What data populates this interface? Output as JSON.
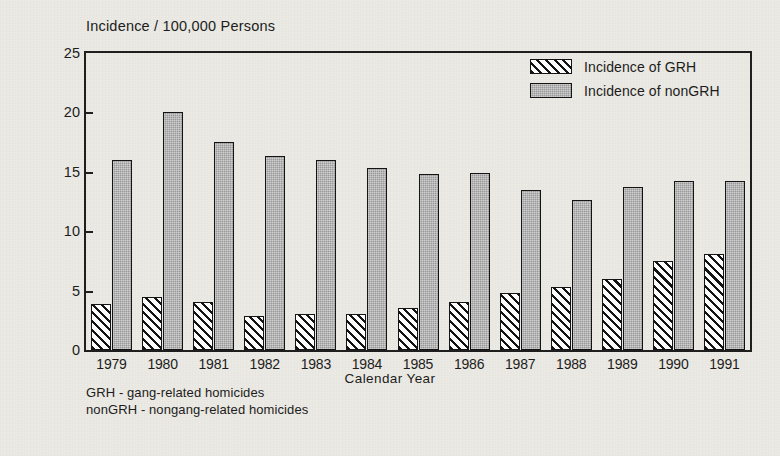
{
  "chart_data": {
    "type": "bar",
    "title": "Incidence / 100,000 Persons",
    "xlabel": "Calendar Year",
    "ylabel": "Percentage",
    "ylim": [
      0,
      25
    ],
    "yticks": [
      0,
      5,
      10,
      15,
      20,
      25
    ],
    "grid": false,
    "legend_position": "top-right",
    "categories": [
      "1979",
      "1980",
      "1981",
      "1982",
      "1983",
      "1984",
      "1985",
      "1986",
      "1987",
      "1988",
      "1989",
      "1990",
      "1991"
    ],
    "series": [
      {
        "name": "Incidence of GRH",
        "fill": "diagonal-hatch",
        "values": [
          3.9,
          4.5,
          4.0,
          2.9,
          3.0,
          3.0,
          3.5,
          4.0,
          4.8,
          5.3,
          6.0,
          7.5,
          8.1
        ]
      },
      {
        "name": "Incidence of nonGRH",
        "fill": "solid-gray",
        "values": [
          16.0,
          20.0,
          17.5,
          16.3,
          16.0,
          15.3,
          14.8,
          14.9,
          13.5,
          12.6,
          13.7,
          14.2,
          14.2
        ]
      }
    ],
    "annotations": [
      "GRH - gang-related homicides",
      "nonGRH - nongang-related homicides"
    ]
  },
  "legend": {
    "items": [
      {
        "label": "Incidence of GRH"
      },
      {
        "label": "Incidence of nonGRH"
      }
    ]
  },
  "footnotes": {
    "line1": "GRH - gang-related homicides",
    "line2": "nonGRH - nongang-related homicides"
  },
  "colors": {
    "grh_fill": "#ffffff",
    "grh_hatch": "#111111",
    "nongrh_fill": "#9a9a9a",
    "axis": "#1c1c1c",
    "paper": "#eceae4",
    "text": "#1a1a1a"
  }
}
